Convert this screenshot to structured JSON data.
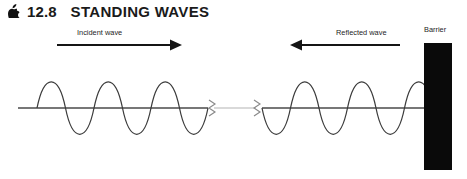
{
  "figure": {
    "section_marker_icon": "apple-bullet-icon",
    "section_number": "12.8",
    "section_title": "STANDING WAVES",
    "labels": {
      "incident": "Incident wave",
      "reflected": "Reflected wave",
      "barrier": "Barrier"
    },
    "colors": {
      "ink": "#1a1a1a",
      "wave_stroke": "#3b3b3b",
      "axis_stroke": "#4a4a4a",
      "axis_faded": "#c9c9c9",
      "barrier_fill": "#0a0a0a",
      "background": "#ffffff"
    }
  },
  "diagram_data": {
    "type": "wave-diagram",
    "axis_y": 108,
    "amplitude_px": 35,
    "break_symbols": [
      {
        "name": "axis-break-left",
        "x": 212,
        "y": 108
      },
      {
        "name": "axis-break-right",
        "x": 257,
        "y": 108
      }
    ],
    "waves": [
      {
        "name": "incident-wave",
        "direction": "rightward",
        "start_x": 37,
        "end_x": 208,
        "cycles": 3,
        "wavelength_px": 57,
        "initial_phase": "crest-first",
        "arrow": {
          "x1": 57,
          "x2": 180,
          "y": 45,
          "points": "right"
        },
        "label": "Incident wave"
      },
      {
        "name": "reflected-wave",
        "direction": "leftward",
        "start_x": 262,
        "end_x": 433,
        "cycles": 3,
        "wavelength_px": 57,
        "initial_phase": "trough-first",
        "arrow": {
          "x1": 288,
          "x2": 400,
          "y": 45,
          "points": "left"
        },
        "label": "Reflected wave"
      }
    ],
    "barrier": {
      "name": "barrier",
      "x": 424,
      "y": 43,
      "width": 28,
      "height": 127,
      "label": "Barrier"
    }
  }
}
